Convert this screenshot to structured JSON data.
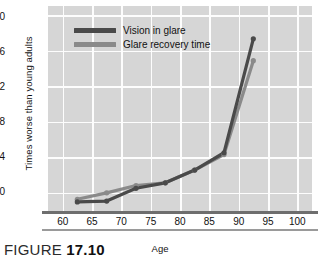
{
  "caption": {
    "prefix": "FIGURE ",
    "number": "17.10"
  },
  "colors": {
    "plot_background": "#d6d6d6",
    "gridline": "#fdfdfd",
    "series_vision": "#4a4a4a",
    "series_recovery": "#8a8a8a",
    "axis_line": "#6e6e6e"
  },
  "chart_data": {
    "type": "line",
    "title": "",
    "xlabel": "Age",
    "ylabel": "Times worse than young adults",
    "xlim": [
      57.5,
      102.5
    ],
    "ylim": [
      -1.6,
      21
    ],
    "xticks": [
      60,
      65,
      70,
      75,
      80,
      85,
      90,
      95,
      100
    ],
    "yticks": [
      0,
      4,
      8,
      12,
      16,
      20
    ],
    "grid": true,
    "legend_position": "top-left-inside",
    "x": [
      62.5,
      67.5,
      72.5,
      77.5,
      82.5,
      87.5,
      92.5
    ],
    "series": [
      {
        "name": "Vision in glare",
        "color": "#4a4a4a",
        "values": [
          -0.5,
          -0.4,
          1.0,
          1.6,
          3.0,
          4.9,
          17.4
        ]
      },
      {
        "name": "Glare recovery time",
        "color": "#8a8a8a",
        "values": [
          -0.2,
          0.5,
          1.3,
          1.6,
          3.0,
          4.7,
          15.0
        ]
      }
    ]
  }
}
